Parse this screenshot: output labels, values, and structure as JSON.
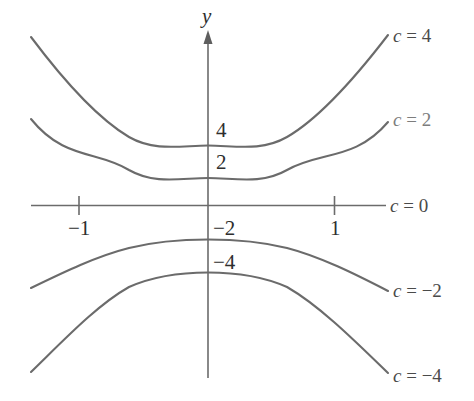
{
  "figure": {
    "axis_labels": {
      "y_axis": "y"
    },
    "x_tick_labels": [
      "-1",
      "1"
    ],
    "y_level_labels": [
      "4",
      "2",
      "-2",
      "-4"
    ],
    "curve_labels": [
      "c = 4",
      "c = 2",
      "c = 0",
      "c = -2",
      "c = -4"
    ],
    "colors": {
      "curve": "#6b6b6b",
      "axis": "#6b6b6b",
      "text": "#2e2e2e",
      "label_light": "#7d7d7d",
      "background": "#ffffff"
    }
  },
  "chart_data": {
    "type": "line",
    "title": "",
    "subtitle": "",
    "xlabel": "",
    "ylabel": "y",
    "xlim": [
      -1.39,
      1.42
    ],
    "ylim": [
      -10.2,
      10.3
    ],
    "grid": false,
    "legend_position": "right-of-curves",
    "xticks": [
      -1,
      1
    ],
    "xticklabels": [
      "-1",
      "1"
    ],
    "yticks": [
      4,
      2,
      -2,
      -4
    ],
    "yticklabels": [
      "4",
      "2",
      "-2",
      "-4"
    ],
    "relation": "level curves of f(x, y) = y - x^2, i.e. y = x^2 + c",
    "annotations": [
      "c = 4",
      "c = 2",
      "c = 0",
      "c = -2",
      "c = -4"
    ],
    "series": [
      {
        "name": "c = 4",
        "label": "c = 4",
        "c": 4,
        "y_intercept": 4,
        "x": [
          -1.39,
          -1.2,
          -1.0,
          -0.8,
          -0.6,
          -0.4,
          -0.2,
          0,
          0.2,
          0.4,
          0.6,
          0.8,
          1.0,
          1.2,
          1.42
        ],
        "values": [
          9.93,
          8.4,
          7.0,
          5.9,
          5.1,
          4.6,
          4.2,
          4.0,
          4.2,
          4.6,
          5.1,
          5.9,
          7.0,
          8.4,
          10.2
        ]
      },
      {
        "name": "c = 2",
        "label": "c = 2",
        "c": 2,
        "y_intercept": 2,
        "x": [
          -1.39,
          -1.2,
          -1.0,
          -0.8,
          -0.6,
          -0.4,
          -0.2,
          0,
          0.2,
          0.4,
          0.6,
          0.8,
          1.0,
          1.2,
          1.42
        ],
        "values": [
          7.93,
          6.4,
          5.0,
          3.9,
          3.1,
          2.6,
          2.2,
          2.0,
          2.2,
          2.6,
          3.1,
          3.9,
          5.0,
          6.4,
          8.2
        ]
      },
      {
        "name": "c = 0",
        "label": "c = 0",
        "c": 0,
        "y_intercept": 0,
        "x": [
          -1.39,
          1.42
        ],
        "values": [
          0,
          0
        ],
        "note": "drawn as the horizontal axis line"
      },
      {
        "name": "c = -2",
        "label": "c = -2",
        "c": -2,
        "y_intercept": -2,
        "x": [
          -1.39,
          -1.2,
          -1.0,
          -0.8,
          -0.6,
          -0.4,
          -0.2,
          0,
          0.2,
          0.4,
          0.6,
          0.8,
          1.0,
          1.2,
          1.42
        ],
        "values": [
          -7.0,
          -6.0,
          -5.1,
          -4.3,
          -3.5,
          -2.8,
          -2.2,
          -2.0,
          -2.2,
          -2.8,
          -3.5,
          -4.3,
          -5.1,
          -6.0,
          -7.2
        ]
      },
      {
        "name": "c = -4",
        "label": "c = -4",
        "c": -4,
        "y_intercept": -4,
        "x": [
          -1.39,
          -1.2,
          -1.0,
          -0.8,
          -0.6,
          -0.4,
          -0.2,
          0,
          0.2,
          0.4,
          0.6,
          0.8,
          1.0,
          1.2,
          1.42
        ],
        "values": [
          -12.1,
          -11.0,
          -10.1,
          -9.3,
          -8.5,
          -7.8,
          -7.2,
          -7.0,
          -7.2,
          -7.8,
          -8.5,
          -9.3,
          -10.1,
          -11.0,
          -12.3
        ]
      }
    ]
  }
}
